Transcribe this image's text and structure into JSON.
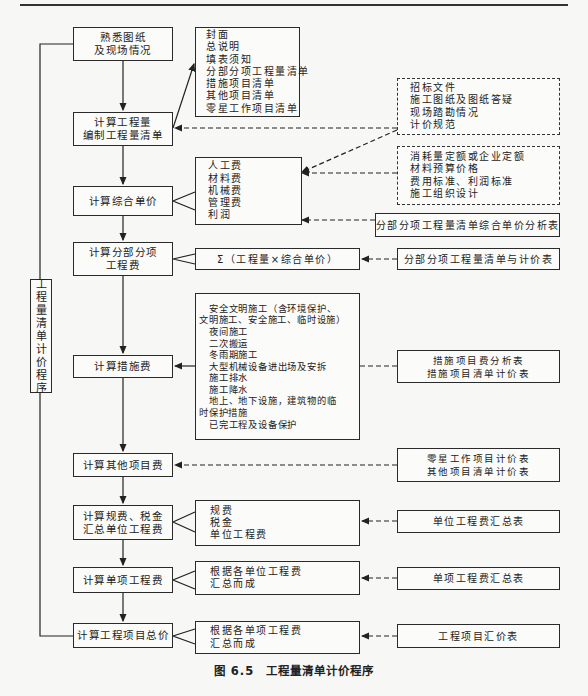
{
  "figure": {
    "caption": "图 6.5　工程量清单计价程序",
    "side_label": [
      "工",
      "程",
      "量",
      "清",
      "单",
      "计",
      "价",
      "程",
      "序"
    ]
  },
  "steps": [
    {
      "id": "familiarize",
      "lines": [
        "熟悉图纸",
        "及现场情况"
      ]
    },
    {
      "id": "calc-quantity",
      "lines": [
        "计算工程量",
        "编制工程量清单"
      ]
    },
    {
      "id": "calc-unit-price",
      "lines": [
        "计算综合单价"
      ]
    },
    {
      "id": "calc-subitem-cost",
      "lines": [
        "计算分部分项",
        "工程费"
      ]
    },
    {
      "id": "calc-measure-cost",
      "lines": [
        "计算措施费"
      ]
    },
    {
      "id": "calc-other-cost",
      "lines": [
        "计算其他项目费"
      ]
    },
    {
      "id": "calc-fees-tax",
      "lines": [
        "计算规费、税金",
        "汇总单位工程费"
      ]
    },
    {
      "id": "calc-single-project",
      "lines": [
        "计算单项工程费"
      ]
    },
    {
      "id": "calc-total-price",
      "lines": [
        "计算工程项目总价"
      ]
    }
  ],
  "details": [
    {
      "id": "bill-contents",
      "lines": [
        "封面",
        "总说明",
        "填表须知",
        "分部分项工程量清单",
        "措施项目清单",
        "其他项目清单",
        "零星工作项目清单"
      ]
    },
    {
      "id": "unit-price-components",
      "lines": [
        "人工费",
        "材料费",
        "机械费",
        "管理费",
        "利润"
      ]
    },
    {
      "id": "subitem-formula",
      "lines": [
        "Σ（工程量×综合单价）"
      ]
    },
    {
      "id": "measure-items",
      "lines": [
        "安全文明施工（含环境保护、",
        "文明施工、安全施工、临时设施）",
        "夜间施工",
        "二次搬运",
        "冬雨期施工",
        "大型机械设备进出场及安拆",
        "施工排水",
        "施工降水",
        "地上、地下设施，建筑物的临",
        "时保护措施",
        "已完工程及设备保护"
      ]
    },
    {
      "id": "fees-components",
      "lines": [
        "规费",
        "税金",
        "单位工程费"
      ]
    },
    {
      "id": "single-project-note",
      "lines": [
        "根据各单位工程费",
        "汇总而成"
      ]
    },
    {
      "id": "total-project-note",
      "lines": [
        "根据各单项工程费",
        "汇总而成"
      ]
    }
  ],
  "inputs": [
    {
      "id": "tender-docs",
      "lines": [
        "招标文件",
        "施工图纸及图纸答疑",
        "现场踏勘情况",
        "计价规范"
      ]
    },
    {
      "id": "quota-docs",
      "lines": [
        "消耗量定额或企业定额",
        "材料预算价格",
        "费用标准、利润标准",
        "施工组织设计"
      ]
    }
  ],
  "forms": [
    {
      "id": "unit-price-analysis",
      "lines": [
        "分部分项工程量清单综合单价分析表"
      ]
    },
    {
      "id": "subitem-pricing",
      "lines": [
        "分部分项工程量清单与计价表"
      ]
    },
    {
      "id": "measure-forms",
      "lines": [
        "措施项目费分析表",
        "措施项目清单计价表"
      ]
    },
    {
      "id": "other-forms",
      "lines": [
        "零星工作项目计价表",
        "其他项目清单计价表"
      ]
    },
    {
      "id": "unit-summary",
      "lines": [
        "单位工程费汇总表"
      ]
    },
    {
      "id": "single-summary",
      "lines": [
        "单项工程费汇总表"
      ]
    },
    {
      "id": "project-summary",
      "lines": [
        "工程项目汇价表"
      ]
    }
  ]
}
